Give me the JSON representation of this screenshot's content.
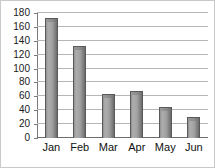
{
  "chart_data": {
    "type": "bar",
    "title": "",
    "subtitle": "",
    "xlabel": "",
    "ylabel": "",
    "categories": [
      "Jan",
      "Feb",
      "Mar",
      "Apr",
      "May",
      "Jun"
    ],
    "values": [
      173,
      133,
      64,
      68,
      44,
      30
    ],
    "ylim": [
      0,
      180
    ],
    "yticks": [
      0,
      20,
      40,
      60,
      80,
      100,
      120,
      140,
      160,
      180
    ],
    "ytick_labels": [
      "0",
      "20",
      "40",
      "60",
      "80",
      "100",
      "120",
      "140",
      "160",
      "180"
    ],
    "grid": true,
    "grid_axis": "y",
    "legend": null,
    "legend_position": "none",
    "annotations": [],
    "colors": {
      "bar_face": "#a2a2a2",
      "bar_highlight": "#aeaeae",
      "bar_shadow": "#6a6a6a",
      "bar_outline": "#5a5a5a",
      "gridline": "#b6b6b6",
      "axis": "#7a7a7a",
      "zero_line": "#6d6d6d",
      "text": "#111111",
      "background": "#ffffff",
      "border": "#c9c9c9"
    }
  }
}
